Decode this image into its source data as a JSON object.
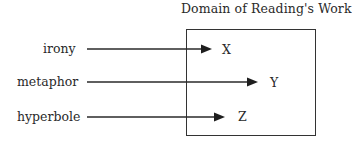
{
  "diagram": {
    "title": "Domain of  Reading's Work",
    "box": {
      "left": 186,
      "top": 29,
      "right": 316,
      "bottom": 136
    },
    "mappings": [
      {
        "source": "irony",
        "target": "X",
        "y": 49,
        "x_start": 87,
        "x_end": 212
      },
      {
        "source": "metaphor",
        "target": "Y",
        "y": 82,
        "x_start": 87,
        "x_end": 258
      },
      {
        "source": "hyperbole",
        "target": "Z",
        "y": 117,
        "x_start": 87,
        "x_end": 225
      }
    ],
    "colors": {
      "line": "#2a2a2a",
      "text": "#2a2a2a",
      "background": "#ffffff"
    }
  }
}
